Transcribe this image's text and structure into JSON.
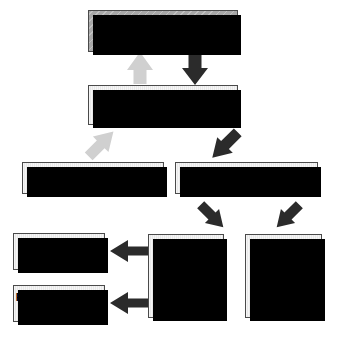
{
  "diagram": {
    "colors": {
      "box_fill_light": "#e8e8e8",
      "box_fill_hatched": "#a8a8a8",
      "box_border": "#4a4a4a",
      "shadow": "#000000",
      "arrow_dark": "#2b2b2b",
      "arrow_light": "#d0d0d0",
      "background": "#ffffff"
    },
    "boxes": [
      {
        "id": "cns",
        "label": "CNS"
      },
      {
        "id": "pns",
        "label": "PNS"
      },
      {
        "id": "sensory",
        "label": "Sensory division"
      },
      {
        "id": "motor",
        "label": "Motor  division"
      },
      {
        "id": "sympathetic",
        "line1": "Sympathetic",
        "line2": "division"
      },
      {
        "id": "parasympathetic",
        "line1": "Parasympathetic",
        "line2": "division"
      },
      {
        "id": "autonomic",
        "line1": "Autonomic",
        "line2": "nervous",
        "line3": "system"
      },
      {
        "id": "somatic",
        "line1": "Somatic",
        "line2": "nervous",
        "line3": "system"
      }
    ],
    "arrows": [
      {
        "id": "pns-to-cns",
        "from": "PNS",
        "to": "CNS",
        "direction": "up",
        "style": "light"
      },
      {
        "id": "cns-to-pns",
        "from": "CNS",
        "to": "PNS",
        "direction": "down",
        "style": "dark"
      },
      {
        "id": "sensory-to-pns",
        "from": "Sensory division",
        "to": "PNS",
        "direction": "up-right",
        "style": "light"
      },
      {
        "id": "pns-to-motor",
        "from": "PNS",
        "to": "Motor  division",
        "direction": "down-right",
        "style": "dark"
      },
      {
        "id": "motor-to-autonomic",
        "from": "Motor  division",
        "to": "Autonomic nervous system",
        "direction": "down-left",
        "style": "dark"
      },
      {
        "id": "motor-to-somatic",
        "from": "Motor  division",
        "to": "Somatic nervous system",
        "direction": "down-right",
        "style": "dark"
      },
      {
        "id": "autonomic-to-symp",
        "from": "Autonomic nervous system",
        "to": "Sympathetic division",
        "direction": "left",
        "style": "dark"
      },
      {
        "id": "autonomic-to-parasymp",
        "from": "Autonomic nervous system",
        "to": "Parasympathetic division",
        "direction": "left",
        "style": "dark"
      }
    ]
  }
}
